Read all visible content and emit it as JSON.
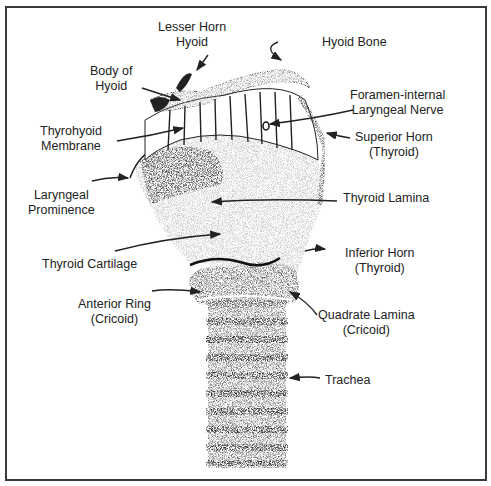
{
  "diagram": {
    "labels": {
      "lesser_horn": [
        "Lesser Horn",
        "Hyoid"
      ],
      "hyoid_bone": [
        "Hyoid Bone"
      ],
      "body_of_hyoid": [
        "Body of",
        "Hyoid"
      ],
      "foramen": [
        "Foramen-internal",
        "Laryngeal Nerve"
      ],
      "thyrohyoid_membrane": [
        "Thyrohyoid",
        "Membrane"
      ],
      "superior_horn": [
        "Superior Horn",
        "(Thyroid)"
      ],
      "laryngeal_prominence": [
        "Laryngeal",
        "Prominence"
      ],
      "thyroid_lamina": [
        "Thyroid Lamina"
      ],
      "inferior_horn": [
        "Inferior Horn",
        "(Thyroid)"
      ],
      "thyroid_cartilage": [
        "Thyroid Cartilage"
      ],
      "anterior_ring": [
        "Anterior Ring",
        "(Cricoid)"
      ],
      "quadrate_lamina": [
        "Quadrate Lamina",
        "(Cricoid)"
      ],
      "trachea": [
        "Trachea"
      ]
    },
    "colors": {
      "ink": "#222222",
      "frame": "#3a3a3a",
      "background": "#ffffff"
    }
  }
}
